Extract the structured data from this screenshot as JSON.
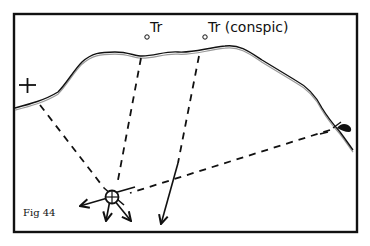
{
  "figure": {
    "caption": "Fig 44",
    "labels": {
      "tr_left": "Tr",
      "tr_right": "Tr (conspic)"
    },
    "symbols": {
      "left_mark": "church-cross-icon",
      "right_mark": "pier-beacon-icon",
      "position_fix": "position-fix-circle-icon"
    },
    "colors": {
      "ink": "#111111",
      "coast_inner": "#9a9a9a",
      "background": "#ffffff"
    }
  }
}
